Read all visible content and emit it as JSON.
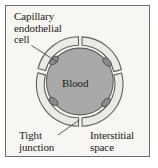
{
  "figure": {
    "background_color": "#f7f6f2",
    "frame_color": "#6d6d6d"
  },
  "labels": {
    "capillary_endothelial_cell": "Capillary\nendothelial\ncell",
    "blood": "Blood",
    "tight_junction": "Tight\njunction",
    "interstitial_space": "Interstitial\nspace"
  },
  "diagram": {
    "lumen_label": "Blood",
    "lumen_fill": "#a9a9a9",
    "lumen_stroke": "#5f5f5f",
    "cell_fill": "#eceae4",
    "cell_stroke": "#5f5f5f",
    "nucleus_fill": "#8a8a8a",
    "nucleus_stroke": "#4a4a4a",
    "leader_color": "#4a4a4a",
    "endothelial_cell_count": 4,
    "nucleus_count": 4,
    "tight_junction_count": 4
  }
}
